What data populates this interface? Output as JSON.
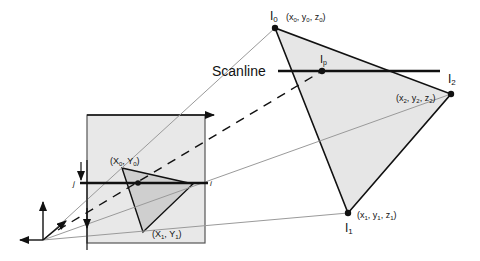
{
  "diagram": {
    "title_label": "Scanline",
    "colors": {
      "triangle_fill": "#e6e6e6",
      "screen_fill": "#e8e8e8",
      "small_triangle_fill": "#cfcfcf",
      "edge": "#111111",
      "ray": "#9a9a9a"
    },
    "vertices": {
      "I0": {
        "name": "I",
        "sub": "0",
        "coords": "(x",
        "c_sub": [
          "0",
          "0",
          "0"
        ]
      },
      "I1": {
        "name": "I",
        "sub": "1"
      },
      "I2": {
        "name": "I",
        "sub": "2"
      },
      "Ip": {
        "name": "I",
        "sub": "p"
      }
    },
    "labels": {
      "I0_name": "I",
      "I0_sub": "0",
      "I0_coords": [
        "(x",
        "0",
        ", y",
        "0",
        ", z",
        "0",
        ")"
      ],
      "I1_name": "I",
      "I1_sub": "1",
      "I1_coords": [
        "(x",
        "1",
        ", y",
        "1",
        ", z",
        "1",
        ")"
      ],
      "I2_name": "I",
      "I2_sub": "2",
      "I2_coords": [
        "(x",
        "2",
        ", y",
        "2",
        ", z",
        "2",
        ")"
      ],
      "Ip_name": "I",
      "Ip_sub": "p",
      "screen_v0": [
        "(X",
        "0",
        ", Y",
        "0",
        ")"
      ],
      "screen_v1": [
        "(X",
        "1",
        ", Y",
        "1",
        ")"
      ],
      "row_label": "j",
      "col_label": "i"
    }
  }
}
